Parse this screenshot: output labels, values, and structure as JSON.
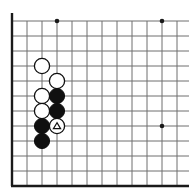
{
  "board": {
    "title": "Go board diagram",
    "type": "go-diagram",
    "background_color": "#ffffff",
    "line_color": "#6e6e6e",
    "edge_color": "#1a1a1a",
    "black_color": "#101010",
    "white_color": "#ffffff",
    "white_outline_color": "#101010",
    "grid_spacing": 15,
    "origin_x": 12,
    "origin_y": 21,
    "columns": 12,
    "rows": 11,
    "edges": {
      "left": true,
      "bottom": true,
      "top": false,
      "right": false
    },
    "star_points": [
      {
        "col": 3,
        "row": 0
      },
      {
        "col": 10,
        "row": 0
      },
      {
        "col": 10,
        "row": 7
      }
    ],
    "stones": [
      {
        "col": 2,
        "row": 3,
        "color": "white",
        "mark": ""
      },
      {
        "col": 3,
        "row": 4,
        "color": "white",
        "mark": ""
      },
      {
        "col": 2,
        "row": 5,
        "color": "white",
        "mark": ""
      },
      {
        "col": 3,
        "row": 5,
        "color": "black",
        "mark": ""
      },
      {
        "col": 2,
        "row": 6,
        "color": "white",
        "mark": ""
      },
      {
        "col": 3,
        "row": 6,
        "color": "black",
        "mark": ""
      },
      {
        "col": 2,
        "row": 7,
        "color": "black",
        "mark": ""
      },
      {
        "col": 3,
        "row": 7,
        "color": "white",
        "mark": "triangle"
      },
      {
        "col": 2,
        "row": 8,
        "color": "black",
        "mark": ""
      }
    ],
    "marks": {
      "triangle_label": "triangle-marker"
    }
  }
}
